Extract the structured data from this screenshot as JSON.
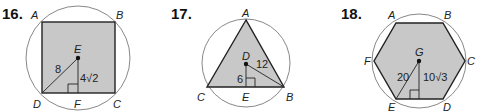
{
  "problems": [
    {
      "number": "16.",
      "shape": "square",
      "vertices": {
        "A": "A",
        "B": "B",
        "C": "C",
        "D": "D"
      },
      "center": "E",
      "foot": "F",
      "radius_label": "8",
      "apothem_label": "4√2"
    },
    {
      "number": "17.",
      "shape": "equilateral-triangle",
      "vertices": {
        "A": "A",
        "B": "B",
        "C": "C"
      },
      "center": "D",
      "foot": "E",
      "radius_label": "12",
      "apothem_label": "6"
    },
    {
      "number": "18.",
      "shape": "regular-hexagon",
      "vertices": {
        "A": "A",
        "B": "B",
        "C": "C",
        "D": "D",
        "E": "E",
        "F": "F"
      },
      "center": "G",
      "radius_label": "20",
      "apothem_label": "10√3"
    }
  ],
  "colors": {
    "fill": "#c8c8c8",
    "stroke": "#222222",
    "circle": "#777777"
  }
}
